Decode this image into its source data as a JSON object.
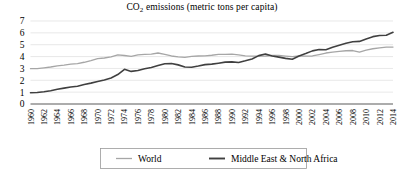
{
  "chart_data": {
    "type": "line",
    "title": "CO2 emissions (metric tons per capita)",
    "title_main": "CO",
    "title_sub": "2",
    "title_rest": " emissions (metric tons per capita)",
    "xlabel": "",
    "ylabel": "",
    "grid": true,
    "legend_position": "bottom",
    "ylim": [
      0,
      7
    ],
    "ytick_step": 1,
    "yticks": [
      0,
      1,
      2,
      3,
      4,
      5,
      6,
      7
    ],
    "xlim": [
      1960,
      2014
    ],
    "xtick_step": 2,
    "x": [
      1960,
      1961,
      1962,
      1963,
      1964,
      1965,
      1966,
      1967,
      1968,
      1969,
      1970,
      1971,
      1972,
      1973,
      1974,
      1975,
      1976,
      1977,
      1978,
      1979,
      1980,
      1981,
      1982,
      1983,
      1984,
      1985,
      1986,
      1987,
      1988,
      1989,
      1990,
      1991,
      1992,
      1993,
      1994,
      1995,
      1996,
      1997,
      1998,
      1999,
      2000,
      2001,
      2002,
      2003,
      2004,
      2005,
      2006,
      2007,
      2008,
      2009,
      2010,
      2011,
      2012,
      2013,
      2014
    ],
    "xticks": [
      "1960",
      "1962",
      "1964",
      "1966",
      "1968",
      "1970",
      "1972",
      "1974",
      "1976",
      "1978",
      "1980",
      "1982",
      "1984",
      "1986",
      "1988",
      "1990",
      "1992",
      "1994",
      "1996",
      "1998",
      "2000",
      "2002",
      "2004",
      "2006",
      "2008",
      "2010",
      "2012",
      "2014"
    ],
    "series": [
      {
        "name": "World",
        "color": "#a6a6a6",
        "width": 1.3,
        "values": [
          2.98,
          2.99,
          3.05,
          3.12,
          3.22,
          3.28,
          3.36,
          3.4,
          3.52,
          3.66,
          3.83,
          3.88,
          3.97,
          4.14,
          4.09,
          4.02,
          4.14,
          4.19,
          4.2,
          4.3,
          4.19,
          4.05,
          3.98,
          3.94,
          4.02,
          4.05,
          4.06,
          4.11,
          4.18,
          4.19,
          4.2,
          4.15,
          4.06,
          4.04,
          4.03,
          4.05,
          4.09,
          4.09,
          4.04,
          4.0,
          4.05,
          4.04,
          4.05,
          4.17,
          4.3,
          4.38,
          4.44,
          4.49,
          4.51,
          4.38,
          4.55,
          4.66,
          4.74,
          4.8,
          4.8
        ]
      },
      {
        "name": "Middle East & North Africa",
        "color": "#404040",
        "width": 1.6,
        "values": [
          0.95,
          0.97,
          1.03,
          1.12,
          1.24,
          1.34,
          1.44,
          1.5,
          1.65,
          1.76,
          1.9,
          2.03,
          2.2,
          2.48,
          2.93,
          2.75,
          2.82,
          2.98,
          3.08,
          3.25,
          3.4,
          3.42,
          3.3,
          3.12,
          3.1,
          3.2,
          3.32,
          3.36,
          3.44,
          3.53,
          3.55,
          3.5,
          3.64,
          3.8,
          4.08,
          4.22,
          4.05,
          3.95,
          3.85,
          3.78,
          4.05,
          4.25,
          4.48,
          4.6,
          4.57,
          4.78,
          4.95,
          5.12,
          5.25,
          5.28,
          5.49,
          5.68,
          5.78,
          5.8,
          6.05
        ]
      }
    ]
  },
  "legend": {
    "items": [
      {
        "label": "World",
        "color": "#a6a6a6"
      },
      {
        "label": "Middle East & North Africa",
        "color": "#404040"
      }
    ]
  }
}
